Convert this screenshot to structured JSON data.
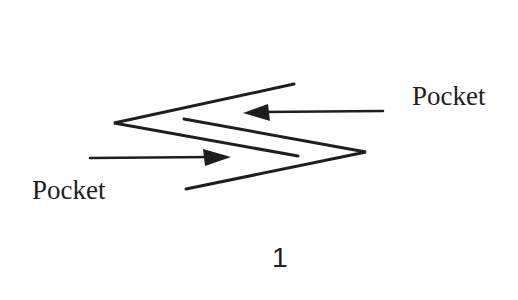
{
  "diagram": {
    "type": "schematic",
    "labels": {
      "top_right": "Pocket",
      "bottom_left": "Pocket"
    },
    "figure_number": "1",
    "colors": {
      "line": "#1e1e1e",
      "background": "#ffffff"
    },
    "elements": {
      "left_chevron": {
        "vertex": [
          114,
          123
        ],
        "upper_end": [
          294,
          84
        ],
        "lower_end": [
          298,
          156
        ],
        "opens": "right"
      },
      "right_chevron": {
        "vertex": [
          366,
          152
        ],
        "upper_end": [
          184,
          119
        ],
        "lower_end": [
          186,
          189
        ],
        "opens": "left"
      },
      "top_arrow": {
        "from": [
          383,
          111
        ],
        "to": [
          244,
          113
        ],
        "direction": "left",
        "points_to": "Pocket (top right)"
      },
      "bottom_arrow": {
        "from": [
          90,
          158
        ],
        "to": [
          230,
          157
        ],
        "direction": "right",
        "points_to": "Pocket (bottom left)"
      }
    }
  }
}
